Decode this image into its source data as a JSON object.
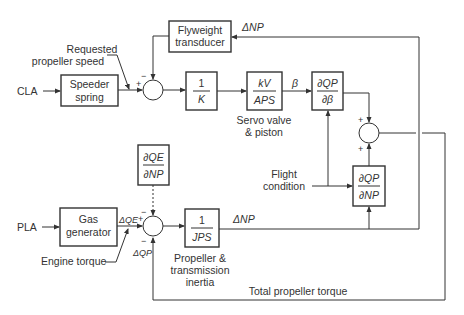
{
  "diagram": {
    "type": "block-diagram",
    "inputs": {
      "cla": "CLA",
      "pla": "PLA"
    },
    "blocks": {
      "speeder_spring": [
        "Speeder",
        "spring"
      ],
      "flyweight": [
        "Flyweight",
        "transducer"
      ],
      "inv_k": {
        "num": "1",
        "den": "K"
      },
      "servo": {
        "num": "kV",
        "den": "APS",
        "caption": [
          "Servo valve",
          "& piston"
        ]
      },
      "dqp_dbeta": {
        "num": "∂QP",
        "den": "∂β"
      },
      "dqp_dnp": {
        "num": "∂QP",
        "den": "∂NP"
      },
      "dqe_dnp": {
        "num": "∂QE",
        "den": "∂NP"
      },
      "gas_generator": [
        "Gas",
        "generator"
      ],
      "inertia": {
        "num": "1",
        "den": "JPS",
        "caption": [
          "Propeller &",
          "transmission",
          "inertia"
        ]
      }
    },
    "labels": {
      "requested_speed": [
        "Requested",
        "propeller speed"
      ],
      "flight_condition": [
        "Flight",
        "condition"
      ],
      "engine_torque": "Engine torque",
      "total_torque": "Total propeller torque",
      "beta": "β",
      "delta_np_top": "ΔNP",
      "delta_np_bottom": "ΔNP",
      "delta_qe": "ΔQE",
      "delta_qp": "ΔQP"
    },
    "signs": {
      "plus": "+",
      "minus": "−"
    }
  }
}
